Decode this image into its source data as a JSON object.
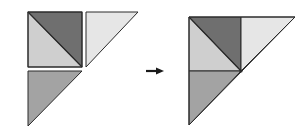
{
  "diagram": {
    "colors": {
      "dark": "#6f6f6f",
      "medium": "#a3a3a3",
      "light": "#cfcfcf",
      "lightest": "#e6e6e6",
      "stroke": "#2a2a2a",
      "arrow": "#1a1a1a"
    },
    "before": {
      "pieces": [
        {
          "name": "square-top-left-dark-triangle",
          "shade": "dark"
        },
        {
          "name": "square-bottom-left-light-triangle",
          "shade": "light"
        },
        {
          "name": "right-separate-triangle",
          "shade": "lightest"
        },
        {
          "name": "bottom-separate-triangle",
          "shade": "medium"
        }
      ]
    },
    "arrow": {
      "direction": "right"
    },
    "after": {
      "pieces": [
        {
          "name": "dark-triangle",
          "shade": "dark"
        },
        {
          "name": "light-triangle",
          "shade": "light"
        },
        {
          "name": "lightest-triangle",
          "shade": "lightest"
        },
        {
          "name": "medium-triangle",
          "shade": "medium"
        }
      ]
    }
  }
}
